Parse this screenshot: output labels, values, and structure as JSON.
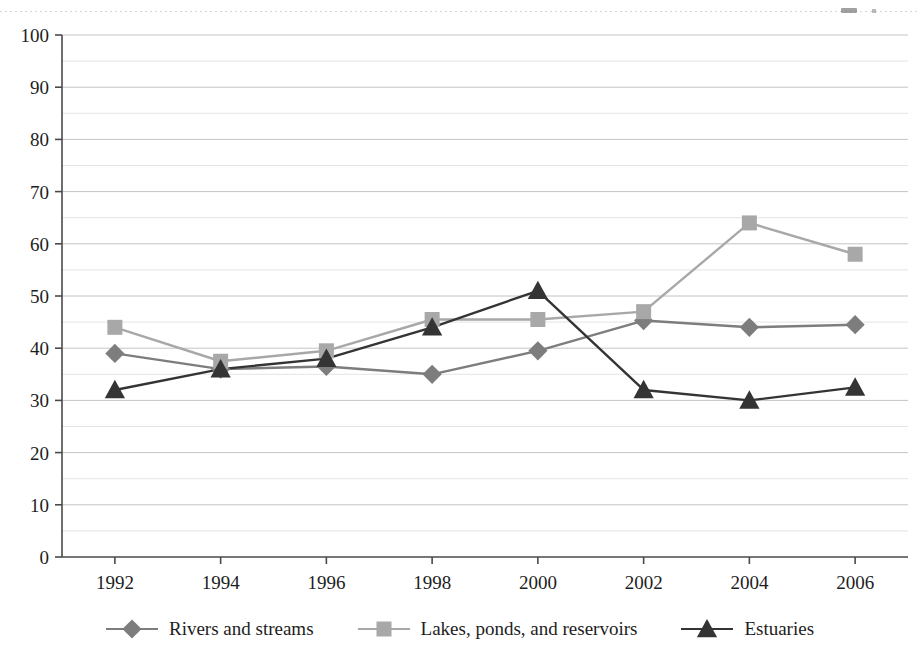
{
  "chart_data": {
    "type": "line",
    "title": "",
    "subtitle": "",
    "xlabel": "",
    "ylabel": "",
    "categories": [
      "1992",
      "1994",
      "1996",
      "1998",
      "2000",
      "2002",
      "2004",
      "2006"
    ],
    "x": [
      1992,
      1994,
      1996,
      1998,
      2000,
      2002,
      2004,
      2006
    ],
    "xlim": [
      1991,
      2007
    ],
    "ylim": [
      0,
      100
    ],
    "yticks": [
      0,
      10,
      20,
      30,
      40,
      50,
      60,
      70,
      80,
      90,
      100
    ],
    "yminor_step": 5,
    "grid": "horizontal",
    "legend_position": "bottom",
    "series": [
      {
        "name": "Rivers and streams",
        "marker": "diamond",
        "color": "#7d7d7d",
        "values": [
          39,
          36,
          36.5,
          35,
          39.5,
          45.3,
          44,
          44.5
        ]
      },
      {
        "name": "Lakes, ponds, and reservoirs",
        "marker": "square",
        "color": "#a8a8a8",
        "values": [
          44,
          37.5,
          39.5,
          45.5,
          45.5,
          47,
          64,
          58
        ]
      },
      {
        "name": "Estuaries",
        "marker": "triangle",
        "color": "#343434",
        "values": [
          32,
          36,
          38,
          44,
          51,
          32,
          30,
          32.5
        ]
      }
    ]
  },
  "axes": {
    "ytick_labels": [
      "100",
      "90",
      "80",
      "70",
      "60",
      "50",
      "40",
      "30",
      "20",
      "10",
      "0"
    ],
    "xtick_labels": [
      "1992",
      "1994",
      "1996",
      "1998",
      "2000",
      "2002",
      "2004",
      "2006"
    ]
  },
  "legend": {
    "items": [
      {
        "label": "Rivers and streams",
        "marker": "diamond-marker-icon",
        "color": "#7d7d7d"
      },
      {
        "label": "Lakes, ponds, and reservoirs",
        "marker": "square-marker-icon",
        "color": "#a8a8a8"
      },
      {
        "label": "Estuaries",
        "marker": "triangle-marker-icon",
        "color": "#343434"
      }
    ]
  },
  "colors": {
    "rivers": "#7d7d7d",
    "lakes": "#a8a8a8",
    "estuaries": "#343434",
    "axis": "#4a4a4a",
    "gridline_major": "#c4c4c4",
    "gridline_minor": "#e4e4e4",
    "text": "#1d1d1d",
    "background": "#ffffff"
  }
}
